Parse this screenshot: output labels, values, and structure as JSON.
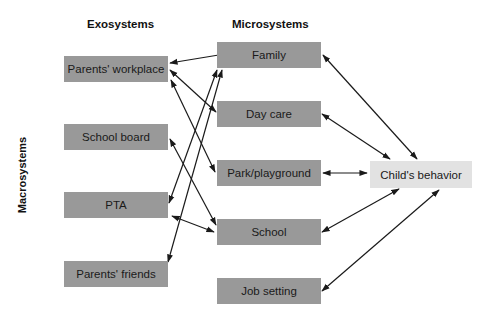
{
  "headings": {
    "exosystems": "Exosystems",
    "microsystems": "Microsystems",
    "macrosystems": "Macrosystems"
  },
  "colors": {
    "box_dark": "#999999",
    "box_light": "#e2e2e2",
    "arrow": "#1a1a1a"
  },
  "exosystems": [
    {
      "id": "parents-workplace",
      "label": "Parents' workplace"
    },
    {
      "id": "school-board",
      "label": "School board"
    },
    {
      "id": "pta",
      "label": "PTA"
    },
    {
      "id": "parents-friends",
      "label": "Parents' friends"
    }
  ],
  "microsystems": [
    {
      "id": "family",
      "label": "Family"
    },
    {
      "id": "day-care",
      "label": "Day care"
    },
    {
      "id": "park-playground",
      "label": "Park/playground"
    },
    {
      "id": "school",
      "label": "School"
    },
    {
      "id": "job-setting",
      "label": "Job setting"
    }
  ],
  "center": {
    "id": "childs-behavior",
    "label": "Child's behavior"
  },
  "connections": [
    {
      "from": "parents-workplace",
      "to": "family",
      "type": "bidirectional"
    },
    {
      "from": "parents-workplace",
      "to": "day-care",
      "type": "bidirectional"
    },
    {
      "from": "parents-workplace",
      "to": "park-playground",
      "type": "bidirectional"
    },
    {
      "from": "school-board",
      "to": "school",
      "type": "bidirectional"
    },
    {
      "from": "pta",
      "to": "family",
      "type": "bidirectional"
    },
    {
      "from": "pta",
      "to": "school",
      "type": "bidirectional"
    },
    {
      "from": "parents-friends",
      "to": "family",
      "type": "bidirectional"
    },
    {
      "from": "family",
      "to": "childs-behavior",
      "type": "bidirectional"
    },
    {
      "from": "day-care",
      "to": "childs-behavior",
      "type": "bidirectional"
    },
    {
      "from": "park-playground",
      "to": "childs-behavior",
      "type": "bidirectional"
    },
    {
      "from": "school",
      "to": "childs-behavior",
      "type": "bidirectional"
    },
    {
      "from": "job-setting",
      "to": "childs-behavior",
      "type": "bidirectional"
    }
  ]
}
